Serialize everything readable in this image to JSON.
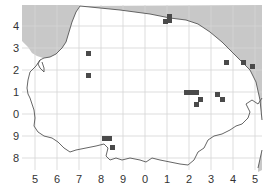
{
  "map": {
    "colors": {
      "sea": "#c8c8c8",
      "land": "#ffffff",
      "grid": "#d4d4d4",
      "coast": "#555555",
      "record": "#4a4a4a",
      "label": "#333333"
    },
    "y_labels": [
      "4",
      "3",
      "2",
      "1",
      "0",
      "9",
      "8"
    ],
    "x_labels": [
      "5",
      "6",
      "7",
      "8",
      "9",
      "0",
      "1",
      "2",
      "3",
      "4",
      "5"
    ],
    "records": [
      {
        "x": 163,
        "y": 19
      },
      {
        "x": 167,
        "y": 14
      },
      {
        "x": 167,
        "y": 18
      },
      {
        "x": 86,
        "y": 51
      },
      {
        "x": 86,
        "y": 73
      },
      {
        "x": 224,
        "y": 60
      },
      {
        "x": 241,
        "y": 60
      },
      {
        "x": 250,
        "y": 64
      },
      {
        "x": 184,
        "y": 90
      },
      {
        "x": 189,
        "y": 90
      },
      {
        "x": 194,
        "y": 90
      },
      {
        "x": 198,
        "y": 97
      },
      {
        "x": 194,
        "y": 102
      },
      {
        "x": 215,
        "y": 92
      },
      {
        "x": 220,
        "y": 97
      },
      {
        "x": 102,
        "y": 136
      },
      {
        "x": 107,
        "y": 136
      },
      {
        "x": 110,
        "y": 145
      }
    ]
  }
}
